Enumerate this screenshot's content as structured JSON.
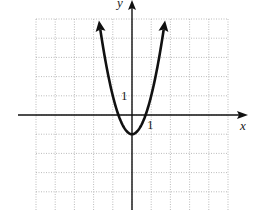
{
  "chart_data": {
    "type": "line",
    "title": "",
    "function": "y = 2x^2 - 1",
    "xlabel": "x",
    "ylabel": "y",
    "xlim": [
      -5,
      5
    ],
    "ylim": [
      -5,
      5
    ],
    "grid": true,
    "grid_style": "dotted",
    "tick_labels": {
      "x": "1",
      "y": "1"
    },
    "vertex": [
      0,
      -1
    ],
    "x_intercepts": [
      -0.71,
      0.71
    ],
    "arrows_at_ends": true,
    "x": [
      -1.73,
      -1.5,
      -1.25,
      -1,
      -0.75,
      -0.5,
      -0.25,
      0,
      0.25,
      0.5,
      0.75,
      1,
      1.25,
      1.5,
      1.73
    ],
    "series": [
      {
        "name": "parabola",
        "values": [
          5,
          3.5,
          2.13,
          1,
          0.13,
          -0.5,
          -0.88,
          -1,
          -0.88,
          -0.5,
          0.13,
          1,
          2.13,
          3.5,
          5
        ]
      }
    ]
  },
  "labels": {
    "x_axis": "x",
    "y_axis": "y",
    "x_tick": "1",
    "y_tick": "1"
  }
}
